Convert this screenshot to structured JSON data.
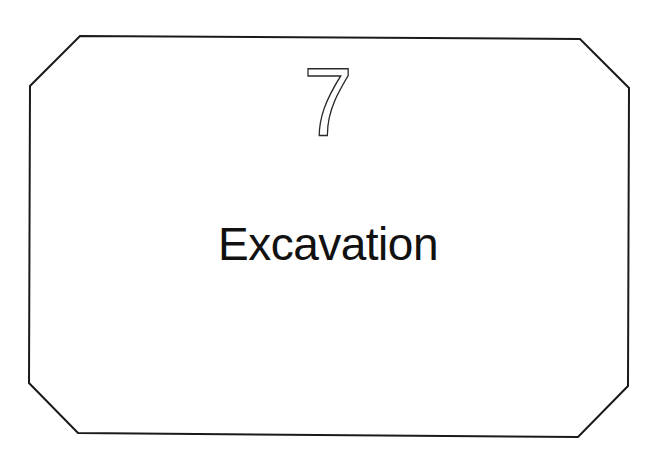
{
  "page": {
    "chapter_number": "7",
    "chapter_title": "Excavation"
  },
  "frame": {
    "shape": "octagon",
    "stroke_color": "#1a1a1a",
    "background": "#ffffff"
  }
}
